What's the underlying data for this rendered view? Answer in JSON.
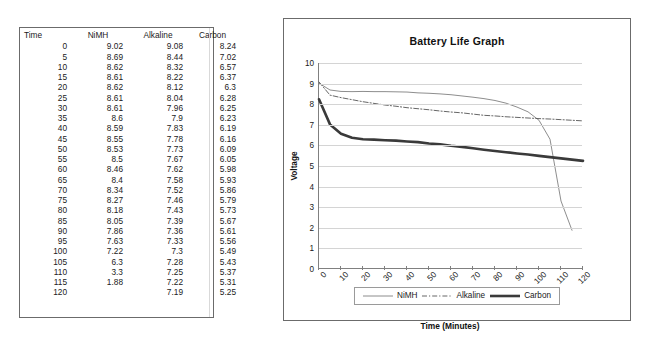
{
  "table": {
    "name": "battery-discharge-table",
    "columns": [
      "Time",
      "NiMH",
      "Alkaline",
      "Carbon"
    ],
    "rows": [
      [
        "0",
        "9.02",
        "9.08",
        "8.24"
      ],
      [
        "5",
        "8.69",
        "8.44",
        "7.02"
      ],
      [
        "10",
        "8.62",
        "8.32",
        "6.57"
      ],
      [
        "15",
        "8.61",
        "8.22",
        "6.37"
      ],
      [
        "20",
        "8.62",
        "8.12",
        "6.3"
      ],
      [
        "25",
        "8.61",
        "8.04",
        "6.28"
      ],
      [
        "30",
        "8.61",
        "7.96",
        "6.25"
      ],
      [
        "35",
        "8.6",
        "7.9",
        "6.23"
      ],
      [
        "40",
        "8.59",
        "7.83",
        "6.19"
      ],
      [
        "45",
        "8.55",
        "7.78",
        "6.16"
      ],
      [
        "50",
        "8.53",
        "7.73",
        "6.09"
      ],
      [
        "55",
        "8.5",
        "7.67",
        "6.05"
      ],
      [
        "60",
        "8.46",
        "7.62",
        "5.98"
      ],
      [
        "65",
        "8.4",
        "7.58",
        "5.93"
      ],
      [
        "70",
        "8.34",
        "7.52",
        "5.86"
      ],
      [
        "75",
        "8.27",
        "7.46",
        "5.79"
      ],
      [
        "80",
        "8.18",
        "7.43",
        "5.73"
      ],
      [
        "85",
        "8.05",
        "7.39",
        "5.67"
      ],
      [
        "90",
        "7.86",
        "7.36",
        "5.61"
      ],
      [
        "95",
        "7.63",
        "7.33",
        "5.56"
      ],
      [
        "100",
        "7.22",
        "7.3",
        "5.49"
      ],
      [
        "105",
        "6.3",
        "7.28",
        "5.43"
      ],
      [
        "110",
        "3.3",
        "7.25",
        "5.37"
      ],
      [
        "115",
        "1.88",
        "7.22",
        "5.31"
      ],
      [
        "120",
        "",
        "7.19",
        "5.25"
      ]
    ]
  },
  "chart_data": {
    "type": "line",
    "title": "Battery Life Graph",
    "xlabel": "Time (Minutes)",
    "ylabel": "Voltage",
    "xlim": [
      0,
      120
    ],
    "ylim": [
      0,
      10
    ],
    "xticks": [
      0,
      10,
      20,
      30,
      40,
      50,
      60,
      70,
      80,
      90,
      100,
      110,
      120
    ],
    "yticks": [
      0,
      1,
      2,
      3,
      4,
      5,
      6,
      7,
      8,
      9,
      10
    ],
    "grid": "horizontal",
    "legend_position": "bottom",
    "x": [
      0,
      5,
      10,
      15,
      20,
      25,
      30,
      35,
      40,
      45,
      50,
      55,
      60,
      65,
      70,
      75,
      80,
      85,
      90,
      95,
      100,
      105,
      110,
      115,
      120
    ],
    "series": [
      {
        "name": "NiMH",
        "style": "solid-thin",
        "color": "#808080",
        "values": [
          9.02,
          8.69,
          8.62,
          8.61,
          8.62,
          8.61,
          8.61,
          8.6,
          8.59,
          8.55,
          8.53,
          8.5,
          8.46,
          8.4,
          8.34,
          8.27,
          8.18,
          8.05,
          7.86,
          7.63,
          7.22,
          6.3,
          3.3,
          1.88,
          null
        ]
      },
      {
        "name": "Alkaline",
        "style": "dash-dot",
        "color": "#555555",
        "values": [
          9.08,
          8.44,
          8.32,
          8.22,
          8.12,
          8.04,
          7.96,
          7.9,
          7.83,
          7.78,
          7.73,
          7.67,
          7.62,
          7.58,
          7.52,
          7.46,
          7.43,
          7.39,
          7.36,
          7.33,
          7.3,
          7.28,
          7.25,
          7.22,
          7.19
        ]
      },
      {
        "name": "Carbon",
        "style": "solid-thick",
        "color": "#3a3a3a",
        "values": [
          8.24,
          7.02,
          6.57,
          6.37,
          6.3,
          6.28,
          6.25,
          6.23,
          6.19,
          6.16,
          6.09,
          6.05,
          5.98,
          5.93,
          5.86,
          5.79,
          5.73,
          5.67,
          5.61,
          5.56,
          5.49,
          5.43,
          5.37,
          5.31,
          5.25
        ]
      }
    ]
  }
}
